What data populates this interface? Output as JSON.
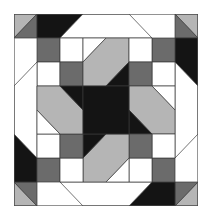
{
  "colors": {
    "white": "#ffffff",
    "lightgray": "#b5b5b5",
    "darkgray": "#6b6b6b",
    "black": "#141414"
  },
  "grid": {
    "cols": 8,
    "rows": 8
  },
  "quadrant_pieces": [
    {
      "name": "corner-light-triangle",
      "color": "lightgray",
      "points": "0,0 1,0 0,1"
    },
    {
      "name": "corner-dark-triangle",
      "color": "darkgray",
      "points": "1,0 1,1 0,1"
    },
    {
      "name": "outer-black-trapezoid",
      "color": "black",
      "points": "1,0 3,0 2,1 1,1"
    },
    {
      "name": "octagon-white-edge",
      "color": "white",
      "points": "3,0 5,0 6,1 2,1"
    },
    {
      "name": "dark-square-a",
      "color": "darkgray",
      "points": "1,1 2,1 2,2 1,2"
    },
    {
      "name": "white-square-a",
      "color": "white",
      "points": "2,1 3,1 3,2 2,2"
    },
    {
      "name": "white-square-b",
      "color": "white",
      "points": "1,2 2,2 2,3 1,3"
    },
    {
      "name": "dark-square-b",
      "color": "darkgray",
      "points": "2,2 3,2 3,3 2,3"
    },
    {
      "name": "white-small-triangle",
      "color": "white",
      "points": "3,1 4,1 3,2"
    },
    {
      "name": "pinwheel-light-arm",
      "color": "lightgray",
      "points": "3,2 4,1 5,1 5,2 4,3 3,3"
    },
    {
      "name": "star-black-point",
      "color": "black",
      "points": "4,3 5,2 5,3"
    }
  ],
  "center_piece": {
    "name": "star-black-center",
    "color": "black",
    "points": "3,3 5,3 5,5 3,5"
  },
  "rotations": [
    0,
    90,
    180,
    270
  ]
}
